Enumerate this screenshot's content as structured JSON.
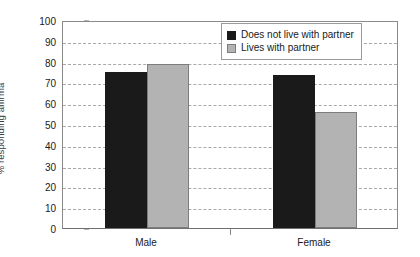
{
  "chart_data": {
    "type": "bar",
    "title": "",
    "subtitle": "",
    "xlabel": "",
    "ylabel": "% responding affirma",
    "categories": [
      "Male",
      "Female"
    ],
    "series": [
      {
        "name": "Does not live with partner",
        "color": "#1a1a1a",
        "values": [
          75,
          73.5
        ]
      },
      {
        "name": "Lives with partner",
        "color": "#b3b3b3",
        "values": [
          79,
          56
        ]
      }
    ],
    "ylim": [
      0,
      100
    ],
    "ytick_step": 10,
    "ytick_labels": [
      "100",
      "90",
      "80",
      "70",
      "60",
      "50",
      "40",
      "30",
      "20",
      "10",
      "0"
    ],
    "grid": true,
    "grid_axis": "y",
    "grid_style": "dashed",
    "legend_position": "top-right",
    "bar_gap_within_group": 0
  },
  "legend": {
    "entries": [
      {
        "label": "Does not live with partner",
        "swatch": "black-swatch"
      },
      {
        "label": "Lives with partner",
        "swatch": "gray-swatch"
      }
    ]
  }
}
